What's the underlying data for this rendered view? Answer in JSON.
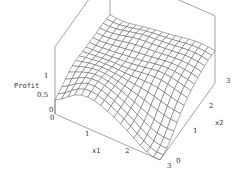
{
  "chart_data": {
    "type": "surface3d",
    "title": "",
    "xlabel": "x1",
    "ylabel": "x2",
    "zlabel": "Profit",
    "xlim": [
      0,
      3
    ],
    "ylim": [
      0,
      3
    ],
    "zlim": [
      0,
      1
    ],
    "x_ticks": [
      "0",
      "1",
      "2",
      "3"
    ],
    "y_ticks": [
      "0",
      "1",
      "2",
      "3"
    ],
    "z_ticks": [
      "0",
      "0.5",
      "1"
    ],
    "grid_resolution": 16,
    "box": true,
    "surface_style": "wireframe mesh, white fill, gray lines"
  },
  "labels": {
    "z_axis": "Profit",
    "x_axis": "x1",
    "y_axis": "x2",
    "z_tick_0": "0",
    "z_tick_05": "0.5",
    "z_tick_1": "1",
    "x_tick_0": "0",
    "x_tick_1": "1",
    "x_tick_2": "2",
    "x_tick_3": "3",
    "y_tick_0": "0",
    "y_tick_1": "1",
    "y_tick_2": "2",
    "y_tick_3": "3"
  },
  "colors": {
    "mesh": "#555555",
    "box": "#666666",
    "background": "#ffffff"
  }
}
